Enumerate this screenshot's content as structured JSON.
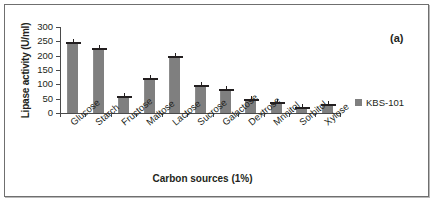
{
  "panel": {
    "tag": "(a)"
  },
  "legend": {
    "position": "right",
    "entries": [
      {
        "label": "KBS-101",
        "color": "#7f7f7f"
      }
    ]
  },
  "colors": {
    "bar_fill": "#7f7f7f",
    "axis": "#4a4a4a",
    "text": "#231f20",
    "frame": "#6f6f6f"
  },
  "chart_data": {
    "type": "bar",
    "title": "",
    "xlabel": "Carbon sources (1%)",
    "ylabel": "Lipase activity (U/ml)",
    "ylim": [
      0,
      300
    ],
    "yticks": [
      0,
      50,
      100,
      150,
      200,
      250,
      300
    ],
    "grid": false,
    "legend_position": "right",
    "categories": [
      "Glucose",
      "Starch",
      "Fructose",
      "Maltose",
      "Lactose",
      "Sucrose",
      "Galactose",
      "Dextrose",
      "Mnnitol",
      "Sorbitol",
      "Xylose"
    ],
    "series": [
      {
        "name": "KBS-101",
        "values": [
          243,
          223,
          55,
          120,
          197,
          95,
          82,
          47,
          35,
          17,
          27
        ]
      }
    ]
  }
}
